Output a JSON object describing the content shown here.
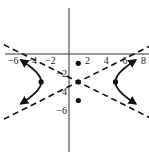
{
  "chart_data": {
    "type": "line",
    "title": "",
    "xlabel": "",
    "ylabel": "",
    "center": [
      1,
      -3
    ],
    "vertices": [
      [
        -3,
        -3
      ],
      [
        5,
        -3
      ]
    ],
    "marked_points": [
      [
        1,
        -1
      ],
      [
        1,
        -3
      ],
      [
        1,
        -5
      ],
      [
        -3,
        -3
      ],
      [
        5,
        -3
      ]
    ],
    "asymptotes": [
      {
        "slope": 0.5,
        "intercept": -3.5,
        "style": "dashed"
      },
      {
        "slope": -0.5,
        "intercept": -2.5,
        "style": "dashed"
      }
    ],
    "x_ticks": [
      {
        "value": -6,
        "label": "-6"
      },
      {
        "value": -4,
        "label": "-4"
      },
      {
        "value": -2,
        "label": "-2"
      },
      {
        "value": 2,
        "label": "2"
      },
      {
        "value": 4,
        "label": "4"
      },
      {
        "value": 6,
        "label": "6"
      },
      {
        "value": 8,
        "label": "8"
      }
    ],
    "y_ticks": [
      {
        "value": -2,
        "label": "-2"
      },
      {
        "value": -4,
        "label": "-4"
      },
      {
        "value": -6,
        "label": "-6"
      }
    ],
    "xlim": [
      -7.4,
      8.6
    ],
    "ylim": [
      -10.5,
      5.8
    ],
    "grid": false,
    "legend": null,
    "colors": {
      "curve": "#111111",
      "axes": "#333333"
    }
  }
}
